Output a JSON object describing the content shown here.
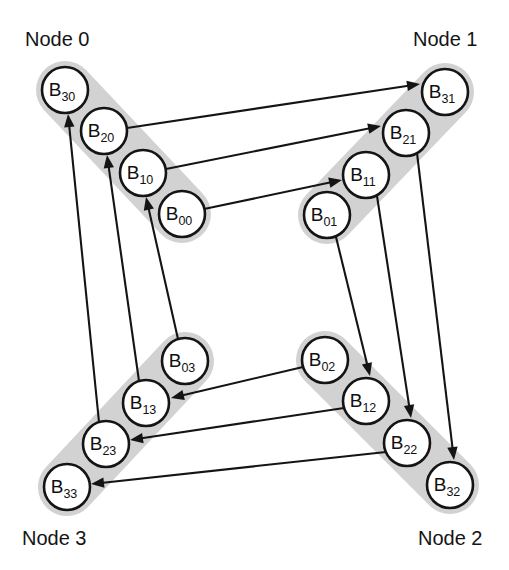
{
  "figure": {
    "width": 509,
    "height": 570,
    "background_color": "#ffffff"
  },
  "style": {
    "band_color": "#d2d2d2",
    "circle_fill": "#ffffff",
    "circle_stroke": "#141414",
    "edge_color": "#141414",
    "text_color": "#141414",
    "circle_radius": 23
  },
  "nodes": [
    {
      "id": "node0",
      "label": "Node 0",
      "label_x": 25,
      "label_y": 46,
      "band": {
        "x1": 65,
        "y1": 90,
        "x2": 182,
        "y2": 214,
        "width": 58
      },
      "blocks": [
        {
          "id": "B30",
          "base": "B",
          "sub": "30",
          "cx": 65,
          "cy": 90
        },
        {
          "id": "B20",
          "base": "B",
          "sub": "20",
          "cx": 104,
          "cy": 131
        },
        {
          "id": "B10",
          "base": "B",
          "sub": "10",
          "cx": 143,
          "cy": 173
        },
        {
          "id": "B00",
          "base": "B",
          "sub": "00",
          "cx": 182,
          "cy": 214
        }
      ]
    },
    {
      "id": "node1",
      "label": "Node 1",
      "label_x": 413,
      "label_y": 46,
      "band": {
        "x1": 445,
        "y1": 92,
        "x2": 327,
        "y2": 215,
        "width": 58
      },
      "blocks": [
        {
          "id": "B31",
          "base": "B",
          "sub": "31",
          "cx": 445,
          "cy": 92
        },
        {
          "id": "B21",
          "base": "B",
          "sub": "21",
          "cx": 406,
          "cy": 133
        },
        {
          "id": "B11",
          "base": "B",
          "sub": "11",
          "cx": 366,
          "cy": 175
        },
        {
          "id": "B01",
          "base": "B",
          "sub": "01",
          "cx": 327,
          "cy": 215
        }
      ]
    },
    {
      "id": "node2",
      "label": "Node 2",
      "label_x": 418,
      "label_y": 545,
      "band": {
        "x1": 325,
        "y1": 360,
        "x2": 450,
        "y2": 485,
        "width": 58
      },
      "blocks": [
        {
          "id": "B02",
          "base": "B",
          "sub": "02",
          "cx": 325,
          "cy": 360
        },
        {
          "id": "B12",
          "base": "B",
          "sub": "12",
          "cx": 366,
          "cy": 401
        },
        {
          "id": "B22",
          "base": "B",
          "sub": "22",
          "cx": 407,
          "cy": 443
        },
        {
          "id": "B32",
          "base": "B",
          "sub": "32",
          "cx": 450,
          "cy": 485
        }
      ]
    },
    {
      "id": "node3",
      "label": "Node 3",
      "label_x": 22,
      "label_y": 545,
      "band": {
        "x1": 185,
        "y1": 361,
        "x2": 67,
        "y2": 487,
        "width": 58
      },
      "blocks": [
        {
          "id": "B03",
          "base": "B",
          "sub": "03",
          "cx": 185,
          "cy": 361
        },
        {
          "id": "B13",
          "base": "B",
          "sub": "13",
          "cx": 146,
          "cy": 403
        },
        {
          "id": "B23",
          "base": "B",
          "sub": "23",
          "cx": 106,
          "cy": 444
        },
        {
          "id": "B33",
          "base": "B",
          "sub": "33",
          "cx": 67,
          "cy": 487
        }
      ]
    }
  ],
  "edges": [
    {
      "id": "e-B20-B31",
      "from": "B20",
      "to": "B31",
      "from_x": 127,
      "from_y": 128,
      "to_x": 420,
      "to_y": 84
    },
    {
      "id": "e-B10-B21",
      "from": "B10",
      "to": "B21",
      "from_x": 166,
      "from_y": 169,
      "to_x": 381,
      "to_y": 126
    },
    {
      "id": "e-B00-B11",
      "from": "B00",
      "to": "B11",
      "from_x": 204,
      "from_y": 209,
      "to_x": 342,
      "to_y": 180
    },
    {
      "id": "e-B21-B32",
      "from": "B21",
      "to": "B32",
      "from_x": 417,
      "from_y": 153,
      "to_x": 454,
      "to_y": 460
    },
    {
      "id": "e-B11-B22",
      "from": "B11",
      "to": "B22",
      "from_x": 377,
      "from_y": 196,
      "to_x": 411,
      "to_y": 418
    },
    {
      "id": "e-B01-B12",
      "from": "B01",
      "to": "B12",
      "from_x": 336,
      "from_y": 237,
      "to_x": 370,
      "to_y": 376
    },
    {
      "id": "e-B02-B13",
      "from": "B02",
      "to": "B13",
      "from_x": 303,
      "from_y": 367,
      "to_x": 171,
      "to_y": 398
    },
    {
      "id": "e-B12-B23",
      "from": "B12",
      "to": "B23",
      "from_x": 344,
      "from_y": 408,
      "to_x": 130,
      "to_y": 440
    },
    {
      "id": "e-B22-B33",
      "from": "B22",
      "to": "B33",
      "from_x": 386,
      "from_y": 452,
      "to_x": 91,
      "to_y": 484
    },
    {
      "id": "e-B03-B10",
      "from": "B03",
      "to": "B10",
      "from_x": 178,
      "from_y": 339,
      "to_x": 146,
      "to_y": 197
    },
    {
      "id": "e-B13-B20",
      "from": "B13",
      "to": "B20",
      "from_x": 139,
      "from_y": 381,
      "to_x": 107,
      "to_y": 155
    },
    {
      "id": "e-B23-B30",
      "from": "B23",
      "to": "B30",
      "from_x": 99,
      "from_y": 422,
      "to_x": 68,
      "to_y": 114
    }
  ]
}
